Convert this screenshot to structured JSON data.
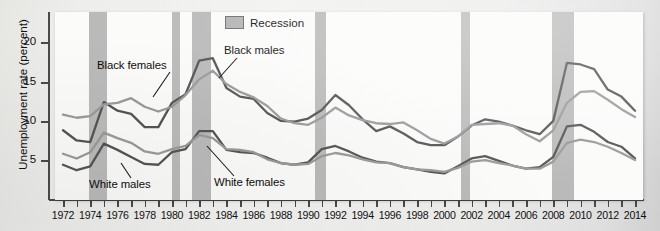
{
  "legend": {
    "recession_label": "Recession",
    "swatch_color": "#b4b4b4"
  },
  "axes": {
    "y_title": "Unemployment rate (percent)",
    "y_ticks": [
      "5",
      "10",
      "15",
      "20"
    ],
    "x_ticks": [
      "1972",
      "1974",
      "1976",
      "1978",
      "1980",
      "1982",
      "1984",
      "1986",
      "1988",
      "1990",
      "1992",
      "1994",
      "1996",
      "1998",
      "2000",
      "2002",
      "2004",
      "2006",
      "2008",
      "2010",
      "2012",
      "2014"
    ]
  },
  "annotations": {
    "black_females": "Black females",
    "black_males": "Black males",
    "white_males": "White males",
    "white_females": "White females"
  },
  "chart_data": {
    "type": "line",
    "title": "",
    "xlabel": "",
    "ylabel": "Unemployment rate (percent)",
    "xlim": [
      1972,
      2014
    ],
    "ylim": [
      0,
      24
    ],
    "yticks": [
      5,
      10,
      15,
      20
    ],
    "grid": false,
    "legend_position": "top-center",
    "x": [
      1972,
      1973,
      1974,
      1975,
      1976,
      1977,
      1978,
      1979,
      1980,
      1981,
      1982,
      1983,
      1984,
      1985,
      1986,
      1987,
      1988,
      1989,
      1990,
      1991,
      1992,
      1993,
      1994,
      1995,
      1996,
      1997,
      1998,
      1999,
      2000,
      2001,
      2002,
      2003,
      2004,
      2005,
      2006,
      2007,
      2008,
      2009,
      2010,
      2011,
      2012,
      2013,
      2014
    ],
    "series": [
      {
        "name": "Black males",
        "color": "#555555",
        "values": [
          8.9,
          7.6,
          7.4,
          12.5,
          11.4,
          11.0,
          9.3,
          9.3,
          12.4,
          13.5,
          17.8,
          18.1,
          14.3,
          13.2,
          12.9,
          11.1,
          10.1,
          10.0,
          10.4,
          11.5,
          13.4,
          12.1,
          10.3,
          8.8,
          9.4,
          8.5,
          7.4,
          7.0,
          7.0,
          8.1,
          9.5,
          10.3,
          10.0,
          9.5,
          8.9,
          8.4,
          10.1,
          17.5,
          17.3,
          16.7,
          14.1,
          13.2,
          11.4
        ]
      },
      {
        "name": "Black females",
        "color": "#9a9a9a",
        "values": [
          10.9,
          10.5,
          10.7,
          12.2,
          12.4,
          13.0,
          11.9,
          11.3,
          11.9,
          13.4,
          15.4,
          16.5,
          14.8,
          13.8,
          13.1,
          12.0,
          10.4,
          9.8,
          9.6,
          10.5,
          11.8,
          10.8,
          10.2,
          9.8,
          9.7,
          9.9,
          8.9,
          7.8,
          7.2,
          8.1,
          9.6,
          9.7,
          9.8,
          9.5,
          8.4,
          7.5,
          8.9,
          12.4,
          13.8,
          13.9,
          12.8,
          11.6,
          10.6
        ]
      },
      {
        "name": "White males",
        "color": "#555555",
        "values": [
          4.5,
          3.8,
          4.3,
          7.2,
          6.4,
          5.5,
          4.6,
          4.5,
          6.1,
          6.5,
          8.8,
          8.8,
          6.4,
          6.1,
          6.0,
          5.4,
          4.7,
          4.5,
          4.8,
          6.5,
          6.9,
          6.2,
          5.4,
          4.9,
          4.7,
          4.2,
          3.9,
          3.6,
          3.4,
          4.3,
          5.3,
          5.6,
          5.0,
          4.4,
          4.0,
          4.2,
          5.5,
          9.4,
          9.6,
          8.7,
          7.4,
          6.8,
          5.3
        ]
      },
      {
        "name": "White females",
        "color": "#9a9a9a",
        "values": [
          5.9,
          5.3,
          6.1,
          8.6,
          7.9,
          7.3,
          6.2,
          5.9,
          6.5,
          6.9,
          8.3,
          7.9,
          6.5,
          6.4,
          6.1,
          5.2,
          4.7,
          4.5,
          4.6,
          5.6,
          6.0,
          5.7,
          5.2,
          4.8,
          4.7,
          4.2,
          3.9,
          3.8,
          3.6,
          4.1,
          4.9,
          5.1,
          4.7,
          4.4,
          4.0,
          4.0,
          4.9,
          7.3,
          7.7,
          7.4,
          6.8,
          6.0,
          5.1
        ]
      }
    ],
    "recessions": [
      {
        "start": 1973.9,
        "end": 1975.2
      },
      {
        "start": 1980.0,
        "end": 1980.6
      },
      {
        "start": 1981.5,
        "end": 1982.9
      },
      {
        "start": 1990.5,
        "end": 1991.3
      },
      {
        "start": 2001.2,
        "end": 2001.9
      },
      {
        "start": 2007.9,
        "end": 2009.5
      }
    ]
  }
}
